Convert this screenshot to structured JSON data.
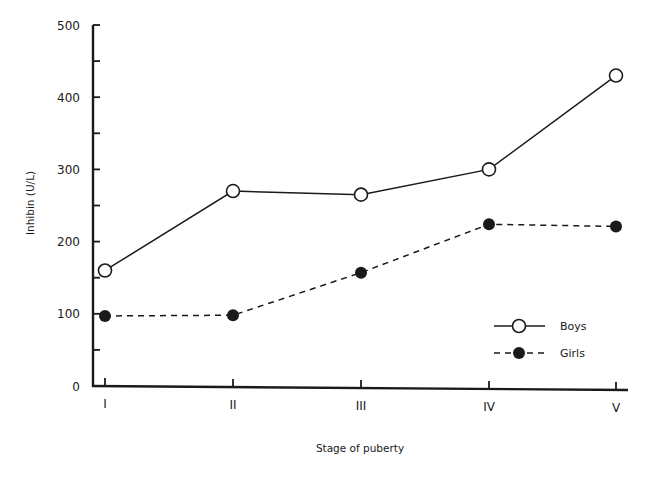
{
  "chart_data": {
    "type": "line",
    "title": "",
    "xlabel": "Stage of puberty",
    "ylabel": "Inhibin (U/L)",
    "categories": [
      "I",
      "II",
      "III",
      "IV",
      "V"
    ],
    "ylim": [
      0,
      500
    ],
    "yticks_major": [
      0,
      100,
      200,
      300,
      400,
      500
    ],
    "yticks_minor": [
      50,
      150,
      250,
      350,
      450
    ],
    "grid": false,
    "legend_position": "lower right",
    "series": [
      {
        "name": "Boys",
        "style": "solid",
        "marker": "open-circle",
        "values": [
          160,
          270,
          265,
          300,
          430
        ]
      },
      {
        "name": "Girls",
        "style": "dashed",
        "marker": "filled-circle",
        "values": [
          97,
          98,
          157,
          224,
          221
        ]
      }
    ]
  },
  "colors": {
    "ink": "#1a1a1a",
    "background": "#ffffff"
  }
}
